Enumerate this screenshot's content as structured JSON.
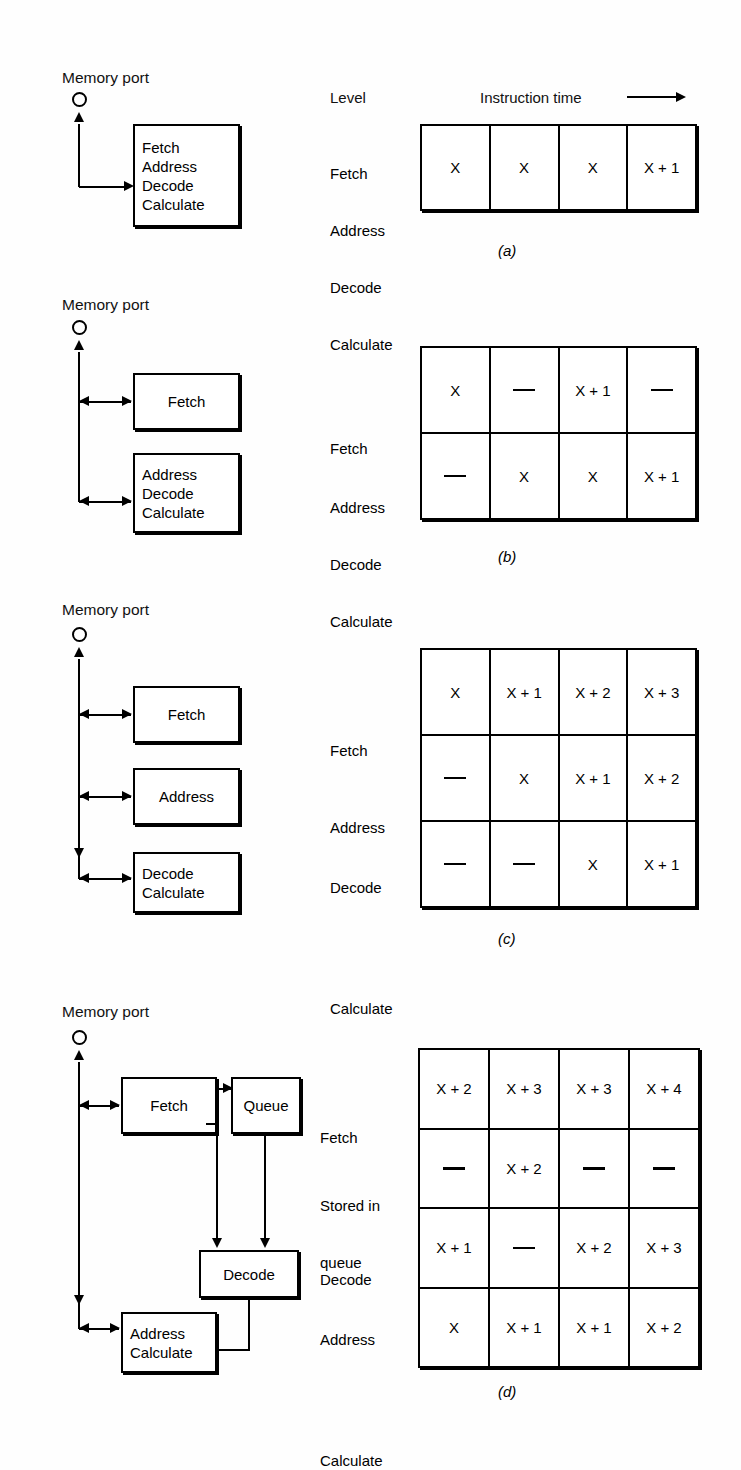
{
  "figure": {
    "memory_port_label": "Memory port",
    "header": {
      "level_label": "Level",
      "instruction_time_label": "Instruction time"
    }
  },
  "panels": [
    {
      "letter": "a",
      "letter_display": "(a)",
      "diagram": {
        "port_label": "Memory port",
        "boxes": [
          {
            "name": "combined-stage",
            "lines": [
              "Fetch",
              "Address",
              "Decode",
              "Calculate"
            ]
          }
        ]
      },
      "table": {
        "column_count": 4,
        "row_labels": [
          [
            "Fetch",
            "Address",
            "Decode",
            "Calculate"
          ]
        ],
        "rows": [
          {
            "label_lines": [
              "Fetch",
              "Address",
              "Decode",
              "Calculate"
            ],
            "cells": [
              "X",
              "X",
              "X",
              "X + 1"
            ]
          }
        ]
      }
    },
    {
      "letter": "b",
      "letter_display": "(b)",
      "diagram": {
        "port_label": "Memory port",
        "boxes": [
          {
            "name": "fetch-stage",
            "lines": [
              "Fetch"
            ]
          },
          {
            "name": "address-decode-calculate-stage",
            "lines": [
              "Address",
              "Decode",
              "Calculate"
            ]
          }
        ]
      },
      "table": {
        "column_count": 4,
        "rows": [
          {
            "label_lines": [
              "Fetch"
            ],
            "cells": [
              "X",
              "—",
              "X + 1",
              "—"
            ]
          },
          {
            "label_lines": [
              "Address",
              "Decode",
              "Calculate"
            ],
            "cells": [
              "—",
              "X",
              "X",
              "X + 1"
            ]
          }
        ]
      }
    },
    {
      "letter": "c",
      "letter_display": "(c)",
      "diagram": {
        "port_label": "Memory port",
        "boxes": [
          {
            "name": "fetch-stage",
            "lines": [
              "Fetch"
            ]
          },
          {
            "name": "address-stage",
            "lines": [
              "Address"
            ]
          },
          {
            "name": "decode-calculate-stage",
            "lines": [
              "Decode",
              "Calculate"
            ]
          }
        ]
      },
      "table": {
        "column_count": 4,
        "rows": [
          {
            "label_lines": [
              "Fetch"
            ],
            "cells": [
              "X",
              "X + 1",
              "X + 2",
              "X + 3"
            ]
          },
          {
            "label_lines": [
              "Address"
            ],
            "cells": [
              "—",
              "X",
              "X + 1",
              "X + 2"
            ]
          },
          {
            "label_lines": [
              "Decode",
              "Calculate"
            ],
            "cells": [
              "—",
              "—",
              "X",
              "X + 1"
            ]
          }
        ]
      }
    },
    {
      "letter": "d",
      "letter_display": "(d)",
      "diagram": {
        "port_label": "Memory port",
        "boxes": [
          {
            "name": "fetch-stage",
            "lines": [
              "Fetch"
            ]
          },
          {
            "name": "queue-stage",
            "lines": [
              "Queue"
            ]
          },
          {
            "name": "decode-stage",
            "lines": [
              "Decode"
            ]
          },
          {
            "name": "address-calculate-stage",
            "lines": [
              "Address",
              "Calculate"
            ]
          }
        ]
      },
      "table": {
        "column_count": 4,
        "rows": [
          {
            "label_lines": [
              "Fetch"
            ],
            "cells": [
              "X + 2",
              "X + 3",
              "X + 3",
              "X + 4"
            ]
          },
          {
            "label_lines": [
              "Stored in",
              "queue"
            ],
            "cells": [
              "—",
              "X + 2",
              "—",
              "—"
            ]
          },
          {
            "label_lines": [
              "Decode"
            ],
            "cells": [
              "X + 1",
              "—",
              "X + 2",
              "X + 3"
            ]
          },
          {
            "label_lines": [
              "Address",
              "Calculate"
            ],
            "cells": [
              "X",
              "X + 1",
              "X + 1",
              "X + 2"
            ]
          }
        ]
      }
    }
  ],
  "colors": {
    "ink": "#000000",
    "paper": "#fefefe"
  }
}
